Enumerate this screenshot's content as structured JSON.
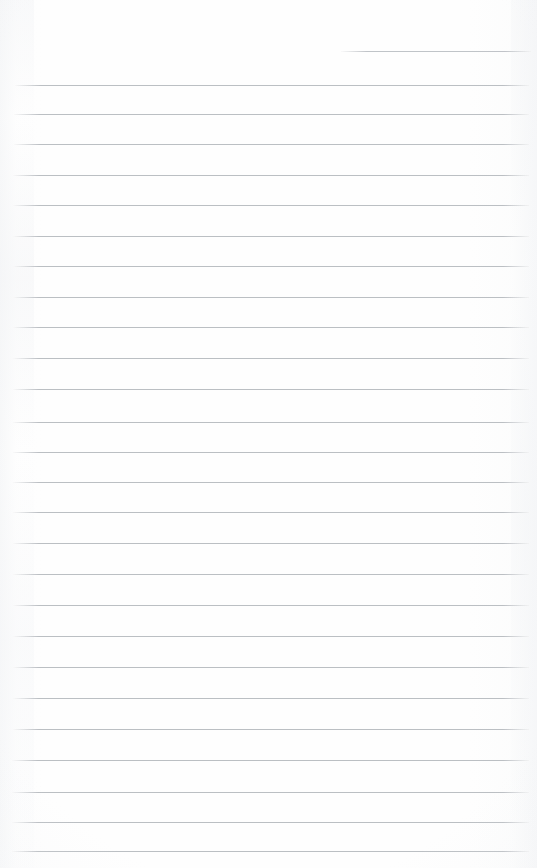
{
  "document": {
    "kind": "scanned-blank-ruled-notebook-page",
    "page_width": 537,
    "page_height": 868,
    "paper_color": "#fdfdfd",
    "rule_color": "#b6babf",
    "rule_thickness_px": 1,
    "written_text": "",
    "has_handwriting": false,
    "has_margin_rule": false,
    "rule_count": 27,
    "partial_rule_count": 1
  },
  "rules": [
    {
      "id": "rule-0",
      "y": 51,
      "x": 341,
      "width": 190,
      "partial": true
    },
    {
      "id": "rule-1",
      "y": 85,
      "x": 15,
      "width": 514,
      "partial": false
    },
    {
      "id": "rule-2",
      "y": 114,
      "x": 14,
      "width": 515,
      "partial": false
    },
    {
      "id": "rule-3",
      "y": 144,
      "x": 14,
      "width": 515,
      "partial": false
    },
    {
      "id": "rule-4",
      "y": 175,
      "x": 13,
      "width": 516,
      "partial": false
    },
    {
      "id": "rule-5",
      "y": 205,
      "x": 13,
      "width": 516,
      "partial": false
    },
    {
      "id": "rule-6",
      "y": 236,
      "x": 13,
      "width": 516,
      "partial": false
    },
    {
      "id": "rule-7",
      "y": 266,
      "x": 13,
      "width": 516,
      "partial": false
    },
    {
      "id": "rule-8",
      "y": 297,
      "x": 13,
      "width": 516,
      "partial": false
    },
    {
      "id": "rule-9",
      "y": 327,
      "x": 13,
      "width": 516,
      "partial": false
    },
    {
      "id": "rule-10",
      "y": 358,
      "x": 13,
      "width": 516,
      "partial": false
    },
    {
      "id": "rule-11",
      "y": 389,
      "x": 13,
      "width": 516,
      "partial": false
    },
    {
      "id": "rule-12",
      "y": 422,
      "x": 13,
      "width": 516,
      "partial": false
    },
    {
      "id": "rule-13",
      "y": 452,
      "x": 13,
      "width": 516,
      "partial": false
    },
    {
      "id": "rule-14",
      "y": 482,
      "x": 13,
      "width": 516,
      "partial": false
    },
    {
      "id": "rule-15",
      "y": 512,
      "x": 13,
      "width": 516,
      "partial": false
    },
    {
      "id": "rule-16",
      "y": 543,
      "x": 13,
      "width": 516,
      "partial": false
    },
    {
      "id": "rule-17",
      "y": 574,
      "x": 13,
      "width": 516,
      "partial": false
    },
    {
      "id": "rule-18",
      "y": 605,
      "x": 13,
      "width": 516,
      "partial": false
    },
    {
      "id": "rule-19",
      "y": 636,
      "x": 13,
      "width": 516,
      "partial": false
    },
    {
      "id": "rule-20",
      "y": 667,
      "x": 13,
      "width": 516,
      "partial": false
    },
    {
      "id": "rule-21",
      "y": 698,
      "x": 13,
      "width": 516,
      "partial": false
    },
    {
      "id": "rule-22",
      "y": 729,
      "x": 13,
      "width": 516,
      "partial": false
    },
    {
      "id": "rule-23",
      "y": 760,
      "x": 12,
      "width": 517,
      "partial": false
    },
    {
      "id": "rule-24",
      "y": 792,
      "x": 12,
      "width": 517,
      "partial": false
    },
    {
      "id": "rule-25",
      "y": 822,
      "x": 12,
      "width": 517,
      "partial": false
    },
    {
      "id": "rule-26",
      "y": 851,
      "x": 12,
      "width": 517,
      "partial": false
    }
  ]
}
